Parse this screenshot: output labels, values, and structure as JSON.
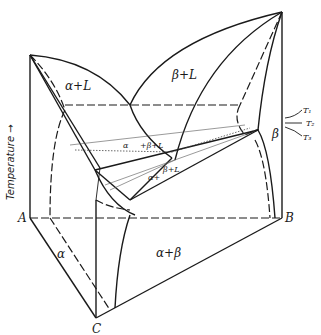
{
  "diagram": {
    "type": "ternary-phase-diagram-3d",
    "axis_label": "Temperature →",
    "vertices": {
      "A": "A",
      "B": "B",
      "C": "C"
    },
    "regions": {
      "alpha_plus_liquid": "α+L",
      "beta_plus_liquid": "β+L",
      "alpha_beta_liquid_upper_alpha": "α",
      "alpha_beta_liquid_upper_rest": "+β+L",
      "alpha_beta_liquid_lower_alpha": "α+",
      "alpha_beta_liquid_lower_rest": "β+L",
      "alpha": "α",
      "beta": "β",
      "alpha_plus_beta": "α+β"
    },
    "temperatures": [
      "T₁",
      "T₂",
      "T₃"
    ],
    "line_color": "#1a1a1a",
    "background": "#ffffff"
  }
}
